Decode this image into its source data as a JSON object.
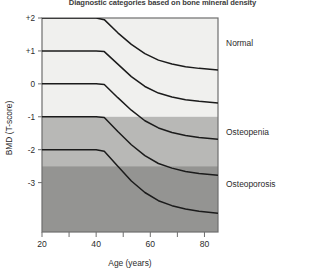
{
  "chart_data": {
    "type": "line",
    "title": "Diagnostic categories based on bone mineral density",
    "xlabel": "Age (years)",
    "ylabel": "BMD (T-score)",
    "xlim": [
      20,
      85
    ],
    "ylim": [
      -4.5,
      2.0
    ],
    "grid": false,
    "legend_position": "right-inside-bands",
    "xticks": [
      20,
      30,
      40,
      50,
      60,
      70,
      80
    ],
    "xticklabels": [
      "20",
      "",
      "40",
      "",
      "60",
      "",
      "80"
    ],
    "yticks": [
      2,
      1,
      0,
      -1,
      -2,
      -3
    ],
    "yticklabels": [
      "+2",
      "+1",
      "0",
      "-1",
      "-2",
      "-3"
    ],
    "x": [
      20,
      30,
      40,
      43,
      48,
      53,
      58,
      63,
      68,
      73,
      78,
      85
    ],
    "series": [
      {
        "name": "97th percentile",
        "values": [
          2.0,
          2.0,
          2.0,
          1.95,
          1.55,
          1.2,
          0.92,
          0.72,
          0.6,
          0.52,
          0.47,
          0.42
        ]
      },
      {
        "name": "84th percentile",
        "values": [
          1.0,
          1.0,
          1.0,
          0.98,
          0.6,
          0.22,
          -0.08,
          -0.28,
          -0.4,
          -0.48,
          -0.53,
          -0.58
        ]
      },
      {
        "name": "50th percentile",
        "values": [
          0.0,
          0.0,
          0.0,
          -0.02,
          -0.42,
          -0.8,
          -1.12,
          -1.34,
          -1.48,
          -1.57,
          -1.63,
          -1.68
        ]
      },
      {
        "name": "16th percentile",
        "values": [
          -1.0,
          -1.0,
          -1.0,
          -1.02,
          -1.45,
          -1.85,
          -2.18,
          -2.42,
          -2.56,
          -2.66,
          -2.72,
          -2.78
        ]
      },
      {
        "name": "3rd percentile",
        "values": [
          -2.0,
          -2.0,
          -2.0,
          -2.05,
          -2.5,
          -2.95,
          -3.3,
          -3.55,
          -3.7,
          -3.8,
          -3.87,
          -3.93
        ]
      }
    ],
    "bands": [
      {
        "label": "Normal",
        "from": 2.0,
        "to": -1.0,
        "color": "#f0f0ee"
      },
      {
        "label": "Osteopenia",
        "from": -1.0,
        "to": -2.5,
        "color": "#b8b8b6"
      },
      {
        "label": "Osteoporosis",
        "from": -2.5,
        "to": -4.5,
        "color": "#949492"
      }
    ],
    "annotations": [
      {
        "text": "Normal",
        "x": 88,
        "y": 1.25
      },
      {
        "text": "Osteopenia",
        "x": 88,
        "y": -1.45
      },
      {
        "text": "Osteoporosis",
        "x": 88,
        "y": -3.05
      }
    ],
    "colors": {
      "curve": "#1b1b1b",
      "axis": "#6e6e6e",
      "band_light": "#f0f0ee",
      "band_medium": "#b8b8b6",
      "band_dark": "#949492",
      "text": "#2b2b2b"
    }
  }
}
